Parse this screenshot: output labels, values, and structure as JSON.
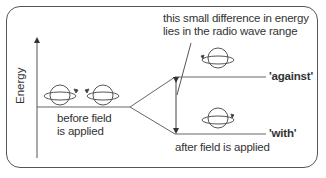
{
  "diagram": {
    "y_axis_label": "Energy",
    "before_label_line1": "before field",
    "before_label_line2": "is applied",
    "annotation_line1": "this small difference in energy",
    "annotation_line2": "lies in the radio wave range",
    "upper_level_label": "'against'",
    "lower_level_label": "'with'",
    "after_label": "after field is applied",
    "colors": {
      "line": "#555555",
      "text": "#333333",
      "background": "#ffffff"
    }
  }
}
